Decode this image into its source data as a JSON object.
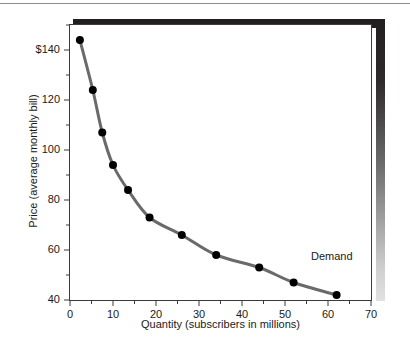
{
  "figure": {
    "background_color": "#ffffff",
    "frame_color": "#3b3b3b",
    "shadow_color": "#231f20",
    "top_rule": ""
  },
  "axes": {
    "x_title": "Quantity (subscribers in millions)",
    "y_title": "Price (average monthly bill)",
    "x_tick_labels": [
      "0",
      "10",
      "20",
      "30",
      "40",
      "50",
      "60",
      "70"
    ],
    "y_tick_labels": [
      "$140",
      "120",
      "100",
      "80",
      "60",
      "40"
    ]
  },
  "annotations": {
    "demand_label": "Demand"
  },
  "chart_data": {
    "type": "line",
    "title": "",
    "xlabel": "Quantity (subscribers in millions)",
    "ylabel": "Price (average monthly bill)",
    "xlim": [
      0,
      70
    ],
    "ylim": [
      40,
      150
    ],
    "xticks": [
      0,
      10,
      20,
      30,
      40,
      50,
      60,
      70
    ],
    "yticks": [
      40,
      60,
      80,
      100,
      120,
      140
    ],
    "minor_xticks": [
      5,
      15,
      25,
      35,
      45,
      55,
      65
    ],
    "minor_yticks": [
      50,
      70,
      90,
      110,
      130,
      150
    ],
    "ytick_labels": [
      "40",
      "60",
      "80",
      "100",
      "120",
      "$140"
    ],
    "grid": false,
    "legend": "inline-annotation",
    "series": [
      {
        "name": "Demand",
        "line_color": "#6a6a6a",
        "marker_color": "#000000",
        "x": [
          2.3,
          5.3,
          7.5,
          10.0,
          13.5,
          18.5,
          26.0,
          34.0,
          44.0,
          52.0,
          62.0
        ],
        "y": [
          144,
          124,
          107,
          94,
          84,
          73,
          66,
          58,
          53,
          47,
          42
        ]
      }
    ]
  }
}
